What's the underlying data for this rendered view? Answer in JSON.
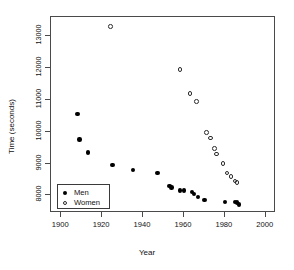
{
  "chart_data": {
    "type": "scatter",
    "title": "",
    "xlabel": "Year",
    "ylabel": "Time (seconds)",
    "xlim": [
      1895,
      2005
    ],
    "ylim": [
      7450,
      13600
    ],
    "xticks": [
      1900,
      1920,
      1940,
      1960,
      1980,
      2000
    ],
    "xtick_labels": [
      "1900",
      "1920",
      "1940",
      "1960",
      "1980",
      "2000"
    ],
    "yticks": [
      8000,
      9000,
      10000,
      11000,
      12000,
      13000
    ],
    "ytick_labels": [
      "8000",
      "9000",
      "10000",
      "11000",
      "12000",
      "13000"
    ],
    "grid": false,
    "legend_position": "bottom-left",
    "series": [
      {
        "name": "Men",
        "marker": "filled-circle",
        "color": "#000000",
        "points": [
          {
            "x": 1908,
            "y": 10550
          },
          {
            "x": 1909,
            "y": 9750
          },
          {
            "x": 1913,
            "y": 9350
          },
          {
            "x": 1925,
            "y": 8950
          },
          {
            "x": 1935,
            "y": 8800
          },
          {
            "x": 1947,
            "y": 8700
          },
          {
            "x": 1953,
            "y": 8300
          },
          {
            "x": 1954,
            "y": 8250
          },
          {
            "x": 1958,
            "y": 8150
          },
          {
            "x": 1960,
            "y": 8150
          },
          {
            "x": 1964,
            "y": 8100
          },
          {
            "x": 1965,
            "y": 8050
          },
          {
            "x": 1967,
            "y": 7950
          },
          {
            "x": 1970,
            "y": 7850
          },
          {
            "x": 1980,
            "y": 7800
          },
          {
            "x": 1985,
            "y": 7800
          },
          {
            "x": 1986,
            "y": 7780
          },
          {
            "x": 1987,
            "y": 7720
          }
        ]
      },
      {
        "name": "Women",
        "marker": "open-circle",
        "color": "#2b2b2b",
        "points": [
          {
            "x": 1924,
            "y": 13300
          },
          {
            "x": 1958,
            "y": 11950
          },
          {
            "x": 1963,
            "y": 11200
          },
          {
            "x": 1966,
            "y": 10950
          },
          {
            "x": 1971,
            "y": 9980
          },
          {
            "x": 1973,
            "y": 9800
          },
          {
            "x": 1975,
            "y": 9480
          },
          {
            "x": 1976,
            "y": 9300
          },
          {
            "x": 1979,
            "y": 9000
          },
          {
            "x": 1981,
            "y": 8700
          },
          {
            "x": 1983,
            "y": 8600
          },
          {
            "x": 1985,
            "y": 8450
          },
          {
            "x": 1986,
            "y": 8400
          }
        ]
      }
    ],
    "legend": [
      {
        "label": "Men",
        "marker": "filled-circle"
      },
      {
        "label": "Women",
        "marker": "open-circle"
      }
    ]
  }
}
